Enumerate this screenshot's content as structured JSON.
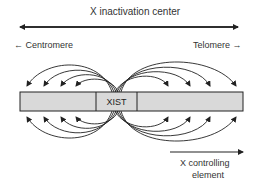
{
  "title": "X inactivation center",
  "left_label": "← Centromere",
  "right_label": "Telomere →",
  "center_gene": "XIST",
  "bottom_label_line1": "X controlling",
  "bottom_label_line2": "element",
  "colors": {
    "bar_fill": "#d9d9d9",
    "stroke": "#222222"
  }
}
